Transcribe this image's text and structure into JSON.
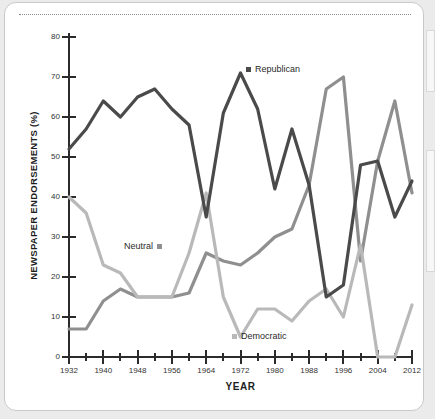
{
  "figure": {
    "card_label": "chart-card",
    "colors": {
      "republican": "#4a4a4a",
      "neutral": "#8f8f8f",
      "democratic": "#b9b9b9",
      "axis": "#2b2b2b",
      "page_background": "#ebebeb",
      "card_background": "#ffffff"
    }
  },
  "chart_data": {
    "type": "line",
    "title": "",
    "xlabel": "YEAR",
    "ylabel": "NEWSPAPER ENDORSEMENTS (%)",
    "xlim": [
      1932,
      2012
    ],
    "ylim": [
      0,
      80
    ],
    "grid": false,
    "legend_position": "inline-annotations",
    "x_major_ticks": [
      1932,
      1940,
      1948,
      1956,
      1964,
      1972,
      1980,
      1988,
      1996,
      2004,
      2012
    ],
    "x_major_tick_labels": [
      "1932",
      "1940",
      "1948",
      "1956",
      "1964",
      "1972",
      "1980",
      "1988",
      "1996",
      "2004",
      "2012"
    ],
    "x_minor_ticks": [
      1936,
      1944,
      1952,
      1960,
      1968,
      1976,
      1984,
      1992,
      2000,
      2008
    ],
    "y_ticks": [
      0,
      10,
      20,
      30,
      40,
      50,
      60,
      70,
      80
    ],
    "y_tick_labels": [
      "0",
      "10",
      "20",
      "30",
      "40",
      "50",
      "60",
      "70",
      "80"
    ],
    "x": [
      1932,
      1936,
      1940,
      1944,
      1948,
      1952,
      1956,
      1960,
      1964,
      1968,
      1972,
      1976,
      1980,
      1984,
      1988,
      1992,
      1996,
      2000,
      2004,
      2008,
      2012
    ],
    "series": [
      {
        "name": "Republican",
        "color": "#4a4a4a",
        "values": [
          52,
          57,
          64,
          60,
          65,
          67,
          62,
          58,
          35,
          61,
          71,
          62,
          42,
          57,
          43,
          15,
          18,
          48,
          49,
          35,
          44
        ]
      },
      {
        "name": "Neutral",
        "color": "#8f8f8f",
        "values": [
          7,
          7,
          14,
          17,
          15,
          15,
          15,
          16,
          26,
          24,
          23,
          26,
          30,
          32,
          43,
          67,
          70,
          24,
          49,
          64,
          41
        ]
      },
      {
        "name": "Democratic",
        "color": "#b9b9b9",
        "values": [
          40,
          36,
          23,
          21,
          15,
          15,
          15,
          26,
          41,
          15,
          5,
          12,
          12,
          9,
          14,
          17,
          10,
          28,
          0,
          0,
          13
        ]
      }
    ],
    "annotations": [
      {
        "label": "Republican",
        "series": "Republican",
        "x": 1973,
        "y": 71
      },
      {
        "label": "Neutral",
        "series": "Neutral",
        "x": 1957,
        "y": 26
      },
      {
        "label": "Democratic",
        "series": "Democratic",
        "x": 1972,
        "y": 5
      }
    ]
  }
}
